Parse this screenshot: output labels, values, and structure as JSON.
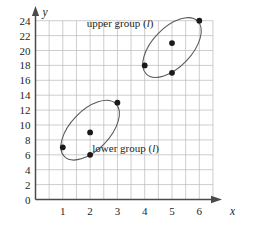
{
  "chart_data": {
    "type": "scatter",
    "title": "",
    "xlabel": "x",
    "ylabel": "y",
    "xlim": [
      0,
      6.5
    ],
    "ylim": [
      0,
      25
    ],
    "xticks": [
      1,
      2,
      3,
      4,
      5,
      6
    ],
    "yticks": [
      0,
      2,
      4,
      6,
      8,
      10,
      12,
      14,
      16,
      18,
      20,
      22,
      24
    ],
    "xtick_labels": [
      "1",
      "2",
      "3",
      "4",
      "5",
      "6"
    ],
    "ytick_labels": [
      "0",
      "2",
      "4",
      "6",
      "8",
      "10",
      "12",
      "14",
      "16",
      "18",
      "20",
      "22",
      "24"
    ],
    "grid": true,
    "grid_x_step": 0.5,
    "grid_y_step": 2,
    "legend": "none",
    "series": [
      {
        "name": "lower group (l)",
        "points": [
          {
            "x": 1,
            "y": 7
          },
          {
            "x": 2,
            "y": 9
          },
          {
            "x": 2,
            "y": 6
          },
          {
            "x": 3,
            "y": 13
          }
        ]
      },
      {
        "name": "upper group (l)",
        "points": [
          {
            "x": 4,
            "y": 18
          },
          {
            "x": 5,
            "y": 21
          },
          {
            "x": 5,
            "y": 17
          },
          {
            "x": 6,
            "y": 24
          }
        ]
      }
    ],
    "annotations": [
      {
        "id": "upper-group-label",
        "text_before": "upper group (",
        "text_italic": "l",
        "text_after": ")",
        "x": 3.1,
        "y": 23.2
      },
      {
        "id": "lower-group-label",
        "text_before": "lower group (",
        "text_italic": "l",
        "text_after": ")",
        "x": 3.3,
        "y": 6.4
      }
    ],
    "ellipses": [
      {
        "id": "lower-group-ellipse",
        "cx": 2.0,
        "cy": 9.3,
        "rx": 1.35,
        "ry": 0.72,
        "rotation_deg": -46
      },
      {
        "id": "upper-group-ellipse",
        "cx": 5.0,
        "cy": 20.4,
        "rx": 1.35,
        "ry": 0.72,
        "rotation_deg": -46
      }
    ]
  },
  "axes": {
    "x_axis_label": "x",
    "y_axis_label": "y"
  },
  "colors": {
    "grid": "#b9b9bb",
    "axis": "#4a4a4d",
    "point": "#1a1a1a",
    "ellipse": "#58585b",
    "text": "#231f20",
    "background": "#ffffff"
  }
}
